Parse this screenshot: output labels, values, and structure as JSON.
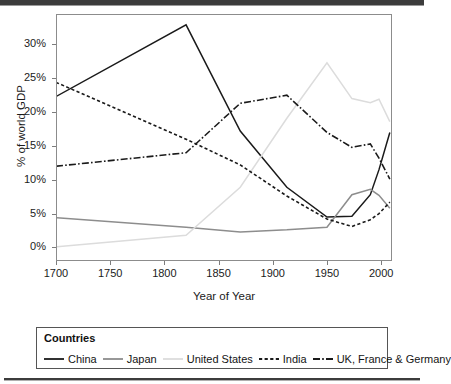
{
  "chart_data": {
    "type": "line",
    "title": "",
    "xlabel": "Year of Year",
    "ylabel": "% of world GDP",
    "xlim": [
      1700,
      2010
    ],
    "ylim": [
      -2,
      34.5
    ],
    "grid": false,
    "legend_position": "bottom",
    "legend_title": "Countries",
    "xticks": [
      1700,
      1750,
      1800,
      1850,
      1900,
      1950,
      2000
    ],
    "xtick_labels": [
      "1700",
      "1750",
      "1800",
      "1850",
      "1900",
      "1950",
      "2000"
    ],
    "yticks": [
      0,
      5,
      10,
      15,
      20,
      25,
      30
    ],
    "ytick_labels": [
      "0%",
      "5%",
      "10%",
      "15%",
      "20%",
      "25%",
      "30%"
    ],
    "series": [
      {
        "name": "China",
        "style": "solid",
        "color": "#1a1a1a",
        "x": [
          1700,
          1820,
          1870,
          1913,
          1950,
          1973,
          1990,
          1998,
          2008
        ],
        "values": [
          22.3,
          32.9,
          17.2,
          8.9,
          4.5,
          4.6,
          7.8,
          11.5,
          17.0
        ]
      },
      {
        "name": "Japan",
        "style": "solid",
        "color": "#8d8d8d",
        "x": [
          1700,
          1820,
          1870,
          1913,
          1950,
          1973,
          1990,
          1998,
          2008
        ],
        "values": [
          4.4,
          3.0,
          2.3,
          2.6,
          3.0,
          7.8,
          8.6,
          7.7,
          5.8
        ]
      },
      {
        "name": "United States",
        "style": "solid",
        "color": "#dcdcdc",
        "x": [
          1700,
          1820,
          1870,
          1913,
          1950,
          1973,
          1990,
          1998,
          2008
        ],
        "values": [
          0.1,
          1.8,
          8.9,
          19.1,
          27.3,
          22.0,
          21.4,
          21.9,
          18.6
        ]
      },
      {
        "name": "India",
        "style": "dashed",
        "color": "#1a1a1a",
        "x": [
          1700,
          1820,
          1870,
          1913,
          1950,
          1973,
          1990,
          1998,
          2008
        ],
        "values": [
          24.4,
          16.0,
          12.2,
          7.6,
          4.2,
          3.1,
          4.1,
          5.0,
          6.7
        ]
      },
      {
        "name": "UK, France & Germany",
        "style": "dashdot",
        "color": "#1a1a1a",
        "x": [
          1700,
          1820,
          1870,
          1913,
          1950,
          1973,
          1990,
          1998,
          2008
        ],
        "values": [
          12.0,
          14.0,
          21.3,
          22.5,
          17.0,
          14.8,
          15.3,
          13.2,
          10.1
        ]
      }
    ]
  },
  "axis": {
    "ylabel": "% of world GDP",
    "xlabel": "Year of Year"
  },
  "legend": {
    "title": "Countries",
    "items": [
      {
        "label": "China",
        "style": "solid",
        "color": "#1a1a1a"
      },
      {
        "label": "Japan",
        "style": "solid",
        "color": "#8d8d8d"
      },
      {
        "label": "United States",
        "style": "solid",
        "color": "#dcdcdc"
      },
      {
        "label": "India",
        "style": "dashed",
        "color": "#1a1a1a"
      },
      {
        "label": "UK, France & Germany",
        "style": "dashdot",
        "color": "#1a1a1a"
      }
    ]
  }
}
